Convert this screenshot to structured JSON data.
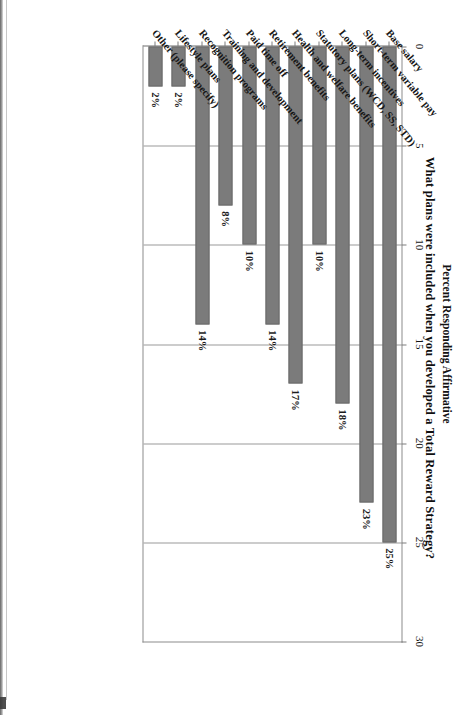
{
  "document": {
    "type": "scanned-chart-page",
    "orientation": "rotated-90-clockwise"
  },
  "chart_data": {
    "type": "bar",
    "orientation": "horizontal",
    "title": "What plans were included when you developed a Total Reward Strategy?",
    "xlabel": "Percent Responding Affirmative",
    "ylabel": "",
    "value_axis_title": "Percent Responding Affirmative",
    "categories": [
      "Base salary",
      "Short-term variable pay",
      "Long-term incentives",
      "Statutory plans (WCD, SS, STD)",
      "Health and welfare benefits",
      "Retirement benefits",
      "Paid time off",
      "Training and development",
      "Recognition programs",
      "Lifestyle plans",
      "Other (please specify)"
    ],
    "values": [
      25,
      23,
      18,
      10,
      17,
      14,
      10,
      8,
      14,
      2,
      2
    ],
    "data_labels": [
      "25%",
      "23%",
      "18%",
      "10%",
      "17%",
      "14%",
      "10%",
      "8%",
      "14%",
      "2%",
      "2%"
    ],
    "ticks": [
      0,
      5,
      10,
      15,
      20,
      25,
      30
    ],
    "tick_labels": [
      "0",
      "5",
      "10",
      "15",
      "20",
      "25",
      "30"
    ],
    "xlim": [
      0,
      30
    ],
    "grid": true,
    "legend": null,
    "bar_color": "#7b7b7b",
    "frame_color": "#8c8c8c",
    "background": "#ffffff"
  }
}
